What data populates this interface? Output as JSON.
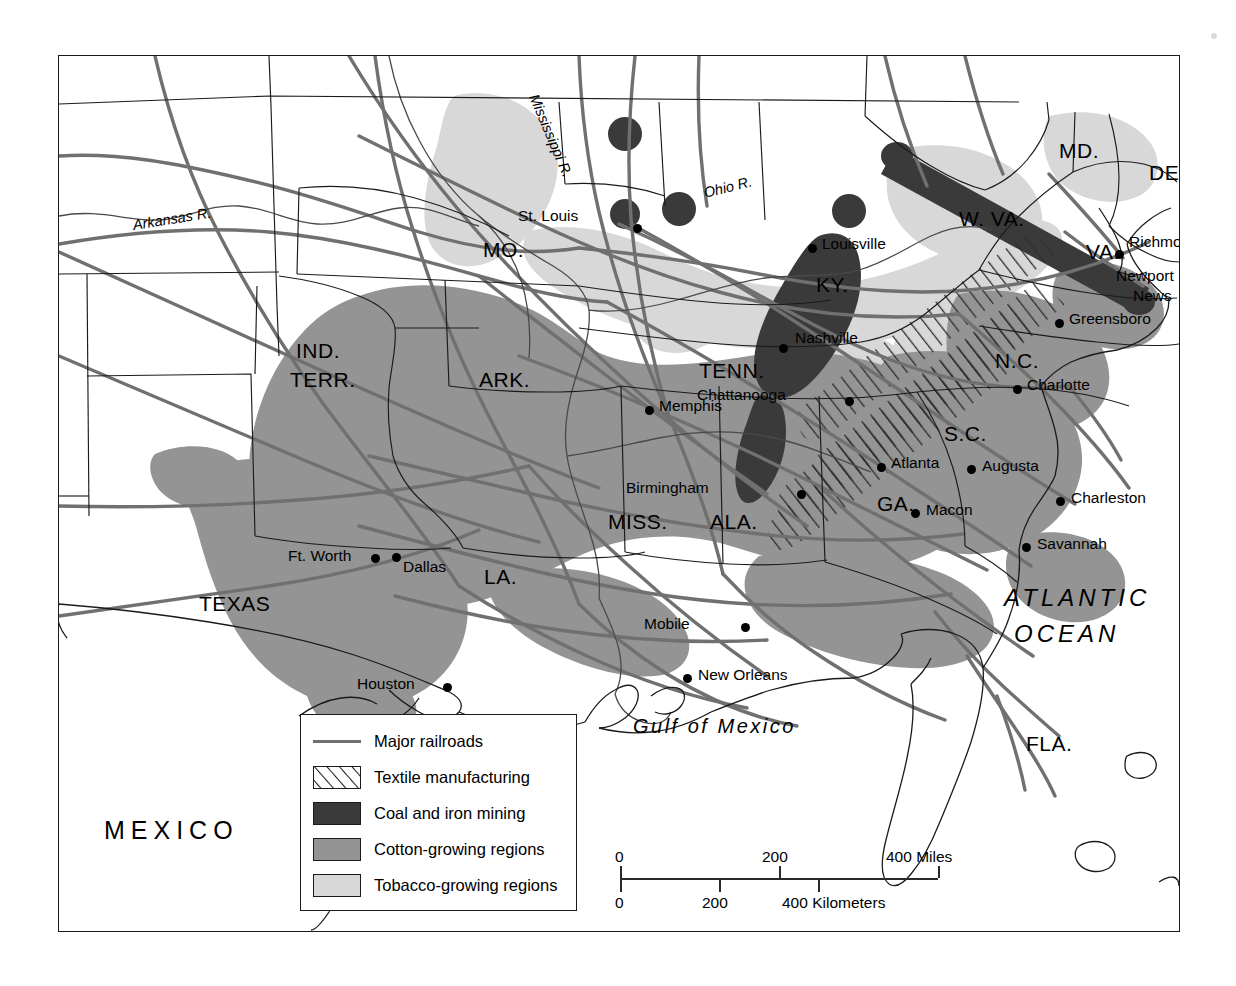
{
  "map": {
    "title_alt": "Economic map of the American South",
    "frame": {
      "x": 58,
      "y": 55,
      "w": 1120,
      "h": 875
    }
  },
  "colors": {
    "coal": "#3a3a3a",
    "cotton": "#949494",
    "tobacco": "#d8d8d8",
    "railroad": "#707070",
    "border": "#1b1b1b",
    "textile_line": "#2f2f2f",
    "water_line": "#555555",
    "background": "#ffffff"
  },
  "legend": {
    "items": [
      {
        "label": "Major railroads",
        "swatch": "line",
        "color": "#707070"
      },
      {
        "label": "Textile manufacturing",
        "swatch": "hatch",
        "color": "#ffffff"
      },
      {
        "label": "Coal and iron mining",
        "swatch": "fill",
        "color": "#3a3a3a"
      },
      {
        "label": "Cotton-growing regions",
        "swatch": "fill",
        "color": "#949494"
      },
      {
        "label": "Tobacco-growing regions",
        "swatch": "fill",
        "color": "#d8d8d8"
      }
    ]
  },
  "scale": {
    "miles": {
      "unit_label": "400 Miles",
      "ticks": [
        "0",
        "200",
        "400 Miles"
      ]
    },
    "kilometers": {
      "unit_label": "400 Kilometers",
      "ticks": [
        "0",
        "200",
        "400 Kilometers"
      ]
    },
    "miles_0": "0",
    "miles_200": "200",
    "miles_400": "400 Miles",
    "km_0": "0",
    "km_200": "200",
    "km_400": "400 Kilometers"
  },
  "states": [
    {
      "id": "mo",
      "label": "MO.",
      "x": 424,
      "y": 183
    },
    {
      "id": "ark",
      "label": "ARK.",
      "x": 420,
      "y": 313
    },
    {
      "id": "ind",
      "label": "IND.",
      "x": 237,
      "y": 284
    },
    {
      "id": "terr",
      "label": "TERR.",
      "x": 231,
      "y": 313
    },
    {
      "id": "tenn",
      "label": "TENN.",
      "x": 640,
      "y": 304
    },
    {
      "id": "ky",
      "label": "KY.",
      "x": 757,
      "y": 218
    },
    {
      "id": "miss",
      "label": "MISS.",
      "x": 549,
      "y": 455
    },
    {
      "id": "ala",
      "label": "ALA.",
      "x": 651,
      "y": 455
    },
    {
      "id": "la",
      "label": "LA.",
      "x": 425,
      "y": 510
    },
    {
      "id": "texas",
      "label": "TEXAS",
      "x": 140,
      "y": 537
    },
    {
      "id": "ga",
      "label": "GA.",
      "x": 818,
      "y": 437
    },
    {
      "id": "sc",
      "label": "S.C.",
      "x": 885,
      "y": 367
    },
    {
      "id": "nc",
      "label": "N.C.",
      "x": 936,
      "y": 294
    },
    {
      "id": "va",
      "label": "VA.",
      "x": 1027,
      "y": 185
    },
    {
      "id": "wva",
      "label": "W. VA.",
      "x": 900,
      "y": 152
    },
    {
      "id": "md",
      "label": "MD.",
      "x": 1000,
      "y": 84
    },
    {
      "id": "del",
      "label": "DEL.",
      "x": 1090,
      "y": 106
    },
    {
      "id": "fla",
      "label": "FLA.",
      "x": 967,
      "y": 677
    }
  ],
  "cities": [
    {
      "name": "St. Louis",
      "lx": 516,
      "ly": 160,
      "dx": 574,
      "dy": 168,
      "anchor": "right"
    },
    {
      "name": "Louisville",
      "lx": 763,
      "ly": 182,
      "dx": 753,
      "dy": 190,
      "anchor": "left"
    },
    {
      "name": "Nashville",
      "lx": 736,
      "ly": 276,
      "dx": 724,
      "dy": 290,
      "anchor": "left"
    },
    {
      "name": "Memphis",
      "lx": 600,
      "ly": 344,
      "dx": 590,
      "dy": 352,
      "anchor": "left"
    },
    {
      "name": "Chattanooga",
      "lx": 697,
      "ly": 330,
      "dx": 786,
      "dy": 341,
      "anchor": "right"
    },
    {
      "name": "Birmingham",
      "lx": 651,
      "ly": 420,
      "dx": 738,
      "dy": 434,
      "anchor": "right"
    },
    {
      "name": "Atlanta",
      "lx": 832,
      "ly": 401,
      "dx": 822,
      "dy": 409,
      "anchor": "left"
    },
    {
      "name": "Augusta",
      "lx": 923,
      "ly": 412,
      "dx": 912,
      "dy": 411,
      "anchor": "left"
    },
    {
      "name": "Macon",
      "lx": 867,
      "ly": 461,
      "dx": 856,
      "dy": 455,
      "anchor": "left"
    },
    {
      "name": "Charleston",
      "lx": 1012,
      "ly": 450,
      "dx": 1001,
      "dy": 443,
      "anchor": "left"
    },
    {
      "name": "Savannah",
      "lx": 978,
      "ly": 495,
      "dx": 967,
      "dy": 489,
      "anchor": "left"
    },
    {
      "name": "Mobile",
      "lx": 636,
      "ly": 561,
      "dx": 682,
      "dy": 569,
      "anchor": "right"
    },
    {
      "name": "New Orleans",
      "lx": 639,
      "ly": 617,
      "dx": 628,
      "dy": 620,
      "anchor": "left"
    },
    {
      "name": "Houston",
      "lx": 319,
      "ly": 627,
      "dx": 384,
      "dy": 629,
      "anchor": "right"
    },
    {
      "name": "Ft. Worth",
      "lx": 243,
      "ly": 500,
      "dx": 312,
      "dy": 500,
      "anchor": "right"
    },
    {
      "name": "Dallas",
      "lx": 344,
      "ly": 509,
      "dx": 337,
      "dy": 499,
      "anchor": "left"
    },
    {
      "name": "Richmond",
      "lx": 1070,
      "ly": 181,
      "dx": 1060,
      "dy": 196,
      "anchor": "left"
    },
    {
      "name": "Newport",
      "lx": 1063,
      "ly": 219,
      "dx": 1124,
      "dy": 208,
      "anchor": "left"
    },
    {
      "name": "News",
      "lx": 1078,
      "ly": 239,
      "dx": -1,
      "dy": -1,
      "anchor": "left"
    },
    {
      "name": "Greensboro",
      "lx": 1010,
      "ly": 260,
      "dx": 1000,
      "dy": 265,
      "anchor": "left"
    },
    {
      "name": "Charlotte",
      "lx": 968,
      "ly": 327,
      "dx": 958,
      "dy": 331,
      "anchor": "left"
    }
  ],
  "water_labels": [
    {
      "name": "Arkansas R.",
      "x": 133,
      "y": 164,
      "rotate": -8
    },
    {
      "name": "Mississippi R.",
      "x": 540,
      "y": 82,
      "rotate": 68
    },
    {
      "name": "Ohio R.",
      "x": 705,
      "y": 176,
      "rotate": -14
    }
  ],
  "ocean_labels": [
    {
      "name": "ATLANTIC",
      "x": 1003,
      "y": 536
    },
    {
      "name": "OCEAN",
      "x": 1013,
      "y": 572
    }
  ],
  "gulf_label": {
    "name": "Gulf of Mexico",
    "x": 632,
    "y": 718
  },
  "country_labels": [
    {
      "name": "MEXICO",
      "x": 103,
      "y": 828
    }
  ]
}
